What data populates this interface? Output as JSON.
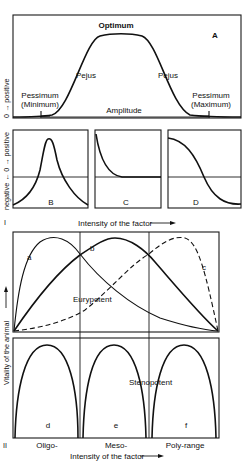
{
  "figure": {
    "part_I_label": "I",
    "part_II_label": "II",
    "panel_A": {
      "letter": "A",
      "y_axis_label": "0 → positive",
      "optimum": "Optimum",
      "pejus_left": "Pejus",
      "pejus_right": "Pejus",
      "pessimum_left_line1": "Pessimum",
      "pessimum_left_line2": "(Minimum)",
      "pessimum_right_line1": "Pessimum",
      "pessimum_right_line2": "(Maximum)",
      "amplitude": "Amplitude"
    },
    "panels_BCD": {
      "y_axis_label": "negative ← 0 → positive",
      "letters": [
        "B",
        "C",
        "D"
      ],
      "x_axis_label": "Intensity of the factor"
    },
    "part_II": {
      "y_axis_label": "Vitality of the animal",
      "curve_labels": [
        "a",
        "b",
        "c"
      ],
      "eurypotent": "Eurypotent",
      "stenopotent": "Stenopotent",
      "subpanel_letters": [
        "d",
        "e",
        "f"
      ],
      "range_labels": [
        "Oligo-",
        "Meso-",
        "Poly-range"
      ],
      "x_axis_label": "Intensity of the factor"
    }
  }
}
